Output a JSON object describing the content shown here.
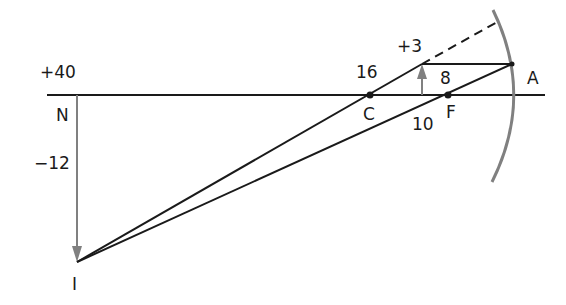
{
  "diagram": {
    "type": "concave-mirror-ray-diagram",
    "labels": {
      "object_distance": "+40",
      "point_n": "N",
      "image_height": "−12",
      "point_i": "I",
      "point_c_distance": "16",
      "point_c": "C",
      "object_height": "+3",
      "focal_distance": "8",
      "point_f": "F",
      "image_distance_segment": "10",
      "point_a": "A"
    },
    "colors": {
      "line": "#1a1a1a",
      "arrow": "#808080",
      "mirror": "#808080"
    }
  }
}
